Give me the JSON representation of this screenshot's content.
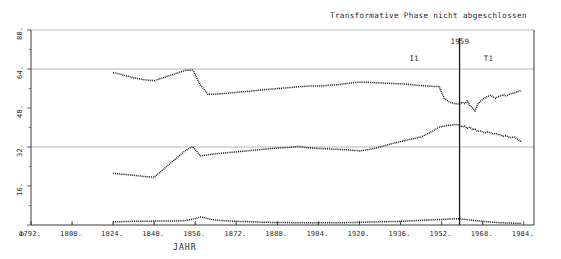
{
  "chart_data": {
    "type": "line",
    "title": "",
    "annotation_top": "Transformative Phase nicht abgeschlossen",
    "xlabel": "JAHR",
    "ylabel": "",
    "xlim": [
      1792,
      1988
    ],
    "ylim": [
      0,
      80
    ],
    "grid": true,
    "gridlines_y": [
      80,
      64,
      32
    ],
    "legend_position": "none",
    "xticks": [
      1792,
      1808,
      1824,
      1840,
      1856,
      1872,
      1888,
      1904,
      1920,
      1936,
      1952,
      1968,
      1984
    ],
    "xticklabels": [
      "1792.",
      "1808.",
      "1824.",
      "1840.",
      "1856.",
      "1872.",
      "1888.",
      "1904.",
      "1920.",
      "1936.",
      "1952.",
      "1968.",
      "1984."
    ],
    "yticks": [
      0,
      16,
      32,
      48,
      64,
      80
    ],
    "yticklabels": [
      "0",
      "16.",
      "32.",
      "48.",
      "64.",
      "80."
    ],
    "annotations": [
      {
        "name": "vertical-marker-1959",
        "type": "vline",
        "x": 1959,
        "label": "1959"
      },
      {
        "name": "phase-label-I1",
        "type": "text",
        "x": 1941,
        "y": 68,
        "label": "I1"
      },
      {
        "name": "phase-label-T1",
        "type": "text",
        "x": 1970,
        "y": 68,
        "label": "T1"
      }
    ],
    "series": [
      {
        "name": "upper-series",
        "style": "dotted-line",
        "color": "#1a1a1a",
        "x": [
          1824,
          1828,
          1832,
          1836,
          1840,
          1844,
          1848,
          1852,
          1855,
          1858,
          1861,
          1864,
          1868,
          1872,
          1876,
          1880,
          1884,
          1888,
          1892,
          1896,
          1900,
          1904,
          1908,
          1912,
          1916,
          1920,
          1924,
          1928,
          1932,
          1936,
          1940,
          1944,
          1948,
          1951,
          1953,
          1955,
          1957,
          1959,
          1960,
          1961,
          1962,
          1963,
          1964,
          1965,
          1966,
          1967,
          1968,
          1969,
          1970,
          1971,
          1972,
          1973,
          1974,
          1975,
          1976,
          1977,
          1978,
          1979,
          1980,
          1981,
          1982,
          1983
        ],
        "values": [
          62.6,
          61.5,
          60.4,
          59.6,
          59.2,
          60.6,
          62.0,
          63.4,
          63.6,
          57.4,
          53.6,
          53.7,
          54.0,
          54.4,
          54.8,
          55.2,
          55.6,
          56.0,
          56.3,
          56.7,
          57.0,
          57.0,
          57.3,
          57.6,
          58.2,
          58.6,
          58.5,
          58.3,
          58.1,
          57.9,
          57.6,
          57.2,
          56.9,
          56.8,
          52.0,
          50.4,
          49.8,
          49.6,
          50.4,
          49.8,
          51.0,
          49.0,
          48.2,
          46.8,
          49.4,
          50.6,
          51.6,
          52.2,
          52.8,
          53.2,
          52.6,
          52.0,
          52.6,
          53.0,
          53.4,
          53.0,
          53.4,
          53.8,
          54.1,
          54.4,
          54.8,
          55.2
        ]
      },
      {
        "name": "middle-series",
        "style": "dotted-line",
        "color": "#1a1a1a",
        "x": [
          1824,
          1828,
          1832,
          1836,
          1840,
          1844,
          1848,
          1852,
          1855,
          1858,
          1861,
          1864,
          1868,
          1872,
          1876,
          1880,
          1884,
          1888,
          1892,
          1896,
          1900,
          1904,
          1908,
          1912,
          1916,
          1920,
          1924,
          1928,
          1932,
          1936,
          1940,
          1944,
          1948,
          1951,
          1953,
          1955,
          1957,
          1959,
          1960,
          1961,
          1962,
          1963,
          1964,
          1965,
          1966,
          1967,
          1968,
          1969,
          1970,
          1971,
          1972,
          1973,
          1974,
          1975,
          1976,
          1977,
          1978,
          1979,
          1980,
          1981,
          1982,
          1983
        ],
        "values": [
          21.2,
          20.8,
          20.4,
          19.9,
          19.6,
          23.2,
          26.8,
          30.4,
          32.2,
          28.4,
          28.8,
          29.2,
          29.6,
          30.0,
          30.4,
          30.8,
          31.2,
          31.6,
          31.8,
          32.2,
          31.7,
          31.4,
          31.2,
          31.0,
          30.8,
          30.4,
          31.0,
          32.0,
          33.2,
          34.2,
          35.2,
          36.1,
          38.2,
          40.1,
          40.6,
          40.9,
          41.2,
          41.0,
          40.2,
          40.6,
          39.6,
          40.2,
          39.2,
          39.4,
          38.4,
          38.6,
          38.2,
          37.8,
          38.2,
          37.9,
          37.4,
          37.6,
          37.1,
          36.9,
          36.4,
          36.6,
          36.2,
          35.8,
          36.2,
          35.6,
          35.0,
          34.2
        ]
      },
      {
        "name": "baseline-series",
        "style": "dotted-line",
        "color": "#1a1a1a",
        "x": [
          1824,
          1828,
          1832,
          1836,
          1840,
          1844,
          1848,
          1852,
          1856,
          1858,
          1860,
          1862,
          1864,
          1868,
          1872,
          1876,
          1880,
          1884,
          1888,
          1892,
          1896,
          1900,
          1904,
          1908,
          1912,
          1916,
          1920,
          1924,
          1928,
          1932,
          1936,
          1940,
          1944,
          1948,
          1952,
          1956,
          1959,
          1962,
          1966,
          1970,
          1974,
          1978,
          1982,
          1983
        ],
        "values": [
          1.3,
          1.4,
          1.5,
          1.5,
          1.6,
          1.6,
          1.6,
          1.8,
          2.6,
          3.3,
          2.9,
          2.3,
          2.0,
          1.7,
          1.5,
          1.4,
          1.2,
          1.1,
          1.0,
          1.0,
          0.9,
          0.9,
          0.9,
          0.9,
          0.9,
          1.0,
          1.1,
          1.2,
          1.3,
          1.4,
          1.5,
          1.7,
          1.9,
          2.1,
          2.3,
          2.5,
          2.6,
          2.2,
          1.7,
          1.3,
          1.0,
          0.8,
          0.7,
          0.7
        ]
      }
    ]
  }
}
